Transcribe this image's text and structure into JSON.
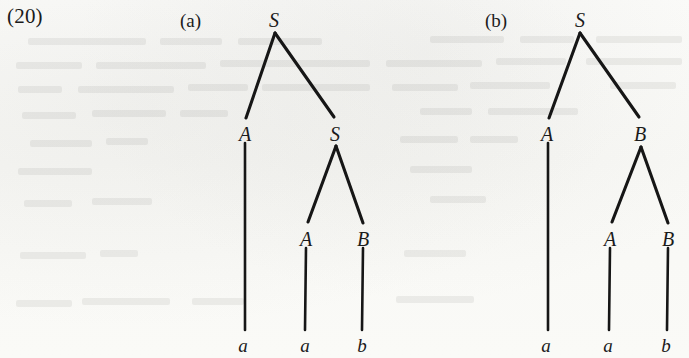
{
  "page": {
    "example_number": "(20)",
    "background_color": "#fbfbf9",
    "ink_color": "#161616"
  },
  "panels": [
    {
      "id": "a",
      "label": "(a)",
      "label_x": 180,
      "label_y": 11
    },
    {
      "id": "b",
      "label": "(b)",
      "label_x": 485,
      "label_y": 11
    }
  ],
  "chart_data": {
    "type": "diagram",
    "diagram_kind": "parse-tree-pair",
    "title": "(20)",
    "derived_string": "aab",
    "trees": [
      {
        "panel": "a",
        "label": "(a)",
        "root": "S",
        "bracketed": "[S [A a] [S [A a] [B b]]]",
        "nodes": [
          {
            "id": "a-s-root",
            "label": "S",
            "level": 0,
            "x": 274,
            "y": 10,
            "kind": "nonterminal"
          },
          {
            "id": "a-a-1",
            "label": "A",
            "level": 1,
            "x": 245,
            "y": 124,
            "kind": "nonterminal"
          },
          {
            "id": "a-s-2",
            "label": "S",
            "level": 1,
            "x": 335,
            "y": 124,
            "kind": "nonterminal"
          },
          {
            "id": "a-a-2",
            "label": "A",
            "level": 2,
            "x": 306,
            "y": 229,
            "kind": "nonterminal"
          },
          {
            "id": "a-b-1",
            "label": "B",
            "level": 2,
            "x": 363,
            "y": 229,
            "kind": "nonterminal"
          },
          {
            "id": "a-t-1",
            "label": "a",
            "level": 3,
            "x": 243,
            "y": 336,
            "kind": "terminal"
          },
          {
            "id": "a-t-2",
            "label": "a",
            "level": 3,
            "x": 305,
            "y": 336,
            "kind": "terminal"
          },
          {
            "id": "a-t-3",
            "label": "b",
            "level": 3,
            "x": 362,
            "y": 336,
            "kind": "terminal"
          }
        ],
        "edges": [
          {
            "from": "a-s-root",
            "to": "a-a-1",
            "x1": 275,
            "y1": 33,
            "x2": 246,
            "y2": 118
          },
          {
            "from": "a-s-root",
            "to": "a-s-2",
            "x1": 275,
            "y1": 33,
            "x2": 334,
            "y2": 117
          },
          {
            "from": "a-a-1",
            "to": "a-t-1",
            "x1": 245,
            "y1": 143,
            "x2": 245,
            "y2": 330
          },
          {
            "from": "a-s-2",
            "to": "a-a-2",
            "x1": 336,
            "y1": 146,
            "x2": 308,
            "y2": 222
          },
          {
            "from": "a-s-2",
            "to": "a-b-1",
            "x1": 336,
            "y1": 146,
            "x2": 363,
            "y2": 223
          },
          {
            "from": "a-a-2",
            "to": "a-t-2",
            "x1": 306,
            "y1": 248,
            "x2": 305,
            "y2": 330
          },
          {
            "from": "a-b-1",
            "to": "a-t-3",
            "x1": 363,
            "y1": 248,
            "x2": 362,
            "y2": 330
          }
        ]
      },
      {
        "panel": "b",
        "label": "(b)",
        "root": "S",
        "bracketed": "[S [A a] [B [A a] [B b]]]",
        "nodes": [
          {
            "id": "b-s-root",
            "label": "S",
            "level": 0,
            "x": 580,
            "y": 10,
            "kind": "nonterminal"
          },
          {
            "id": "b-a-1",
            "label": "A",
            "level": 1,
            "x": 547,
            "y": 124,
            "kind": "nonterminal"
          },
          {
            "id": "b-b-1",
            "label": "B",
            "level": 1,
            "x": 640,
            "y": 124,
            "kind": "nonterminal"
          },
          {
            "id": "b-a-2",
            "label": "A",
            "level": 2,
            "x": 610,
            "y": 229,
            "kind": "nonterminal"
          },
          {
            "id": "b-b-2",
            "label": "B",
            "level": 2,
            "x": 668,
            "y": 229,
            "kind": "nonterminal"
          },
          {
            "id": "b-t-1",
            "label": "a",
            "level": 3,
            "x": 546,
            "y": 336,
            "kind": "terminal"
          },
          {
            "id": "b-t-2",
            "label": "a",
            "level": 3,
            "x": 608,
            "y": 336,
            "kind": "terminal"
          },
          {
            "id": "b-t-3",
            "label": "b",
            "level": 3,
            "x": 666,
            "y": 336,
            "kind": "terminal"
          }
        ],
        "edges": [
          {
            "from": "b-s-root",
            "to": "b-a-1",
            "x1": 580,
            "y1": 33,
            "x2": 549,
            "y2": 118
          },
          {
            "from": "b-s-root",
            "to": "b-b-1",
            "x1": 580,
            "y1": 33,
            "x2": 639,
            "y2": 117
          },
          {
            "from": "b-a-1",
            "to": "b-t-1",
            "x1": 548,
            "y1": 143,
            "x2": 548,
            "y2": 330
          },
          {
            "from": "b-b-1",
            "to": "b-a-2",
            "x1": 641,
            "y1": 147,
            "x2": 612,
            "y2": 222
          },
          {
            "from": "b-b-1",
            "to": "b-b-2",
            "x1": 641,
            "y1": 147,
            "x2": 668,
            "y2": 223
          },
          {
            "from": "b-a-2",
            "to": "b-t-2",
            "x1": 610,
            "y1": 248,
            "x2": 609,
            "y2": 330
          },
          {
            "from": "b-b-2",
            "to": "b-t-3",
            "x1": 668,
            "y1": 248,
            "x2": 667,
            "y2": 330
          }
        ]
      }
    ]
  },
  "ghost_text_blocks": [
    {
      "x": 28,
      "y": 38,
      "w": 118
    },
    {
      "x": 160,
      "y": 38,
      "w": 62
    },
    {
      "x": 238,
      "y": 38,
      "w": 84
    },
    {
      "x": 430,
      "y": 36,
      "w": 74
    },
    {
      "x": 520,
      "y": 36,
      "w": 54
    },
    {
      "x": 596,
      "y": 36,
      "w": 86
    },
    {
      "x": 16,
      "y": 62,
      "w": 66
    },
    {
      "x": 96,
      "y": 62,
      "w": 110
    },
    {
      "x": 220,
      "y": 60,
      "w": 150
    },
    {
      "x": 386,
      "y": 60,
      "w": 96
    },
    {
      "x": 496,
      "y": 58,
      "w": 70
    },
    {
      "x": 586,
      "y": 58,
      "w": 96
    },
    {
      "x": 18,
      "y": 86,
      "w": 44
    },
    {
      "x": 78,
      "y": 86,
      "w": 96
    },
    {
      "x": 188,
      "y": 84,
      "w": 60
    },
    {
      "x": 262,
      "y": 84,
      "w": 108
    },
    {
      "x": 392,
      "y": 84,
      "w": 66
    },
    {
      "x": 470,
      "y": 82,
      "w": 80
    },
    {
      "x": 610,
      "y": 82,
      "w": 66
    },
    {
      "x": 22,
      "y": 112,
      "w": 54
    },
    {
      "x": 92,
      "y": 110,
      "w": 74
    },
    {
      "x": 180,
      "y": 110,
      "w": 48
    },
    {
      "x": 420,
      "y": 108,
      "w": 52
    },
    {
      "x": 488,
      "y": 108,
      "w": 90
    },
    {
      "x": 30,
      "y": 140,
      "w": 62
    },
    {
      "x": 106,
      "y": 138,
      "w": 42
    },
    {
      "x": 400,
      "y": 136,
      "w": 58
    },
    {
      "x": 470,
      "y": 136,
      "w": 48
    },
    {
      "x": 18,
      "y": 168,
      "w": 74
    },
    {
      "x": 410,
      "y": 166,
      "w": 62
    },
    {
      "x": 24,
      "y": 200,
      "w": 48
    },
    {
      "x": 92,
      "y": 198,
      "w": 60
    },
    {
      "x": 430,
      "y": 196,
      "w": 56
    },
    {
      "x": 20,
      "y": 252,
      "w": 66
    },
    {
      "x": 100,
      "y": 250,
      "w": 38
    },
    {
      "x": 404,
      "y": 250,
      "w": 62
    },
    {
      "x": 16,
      "y": 300,
      "w": 56
    },
    {
      "x": 82,
      "y": 298,
      "w": 88
    },
    {
      "x": 192,
      "y": 298,
      "w": 52
    },
    {
      "x": 396,
      "y": 296,
      "w": 78
    }
  ]
}
